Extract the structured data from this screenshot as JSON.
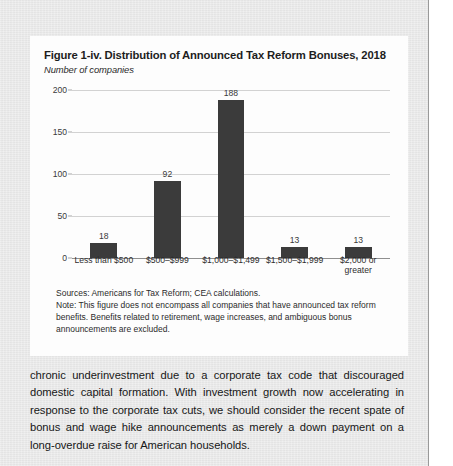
{
  "figure": {
    "title": "Figure 1-iv. Distribution of Announced Tax Reform Bonuses, 2018",
    "subtitle": "Number of companies",
    "sources": "Sources: Americans for Tax Reform; CEA calculations.",
    "note": "Note: This figure does not encompass all companies that have announced tax reform benefits. Benefits related to retirement, wage increases, and ambiguous bonus announcements are excluded."
  },
  "chart_data": {
    "type": "bar",
    "title": "Figure 1-iv. Distribution of Announced Tax Reform Bonuses, 2018",
    "subtitle": "Number of companies",
    "xlabel": "",
    "ylabel": "Number of companies",
    "ylim": [
      0,
      200
    ],
    "yticks": [
      0,
      50,
      100,
      150,
      200
    ],
    "grid": true,
    "legend": false,
    "bar_color": "#3b3b3b",
    "gridline_color": "#d2d2d2",
    "categories": [
      "Less than $500",
      "$500–$999",
      "$1,000–$1,499",
      "$1,500–$1,999",
      "$2,000 or greater"
    ],
    "values": [
      18,
      92,
      188,
      13,
      13
    ],
    "data_labels": [
      "18",
      "92",
      "188",
      "13",
      "13"
    ]
  },
  "body": {
    "paragraph": "chronic underinvestment due to a corporate tax code that discouraged domestic capital formation. With investment growth now accelerating in response to the corporate tax cuts, we should consider the recent spate of bonus and wage hike announcements as merely a down payment on a long-overdue raise for American households."
  }
}
